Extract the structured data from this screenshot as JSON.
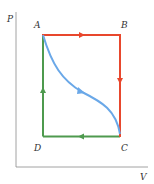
{
  "diagram": {
    "type": "PV cycle diagram",
    "axes": {
      "y_label": "P",
      "x_label": "V"
    },
    "points": {
      "A": "A",
      "B": "B",
      "C": "C",
      "D": "D"
    },
    "paths": [
      {
        "name": "A-B",
        "from": "A",
        "to": "B",
        "direction": "right",
        "color": "#e8472d"
      },
      {
        "name": "B-C",
        "from": "B",
        "to": "C",
        "direction": "down",
        "color": "#e8472d"
      },
      {
        "name": "C-D",
        "from": "C",
        "to": "D",
        "direction": "left",
        "color": "#4e9a4e"
      },
      {
        "name": "D-A",
        "from": "D",
        "to": "A",
        "direction": "up",
        "color": "#4e9a4e"
      },
      {
        "name": "A-C curve",
        "from": "A",
        "to": "C",
        "direction": "down-right",
        "color": "#6aa8e8"
      }
    ],
    "colors": {
      "red": "#e8472d",
      "green": "#4e9a4e",
      "blue": "#6aa8e8",
      "axis": "#8a8a8a"
    }
  }
}
